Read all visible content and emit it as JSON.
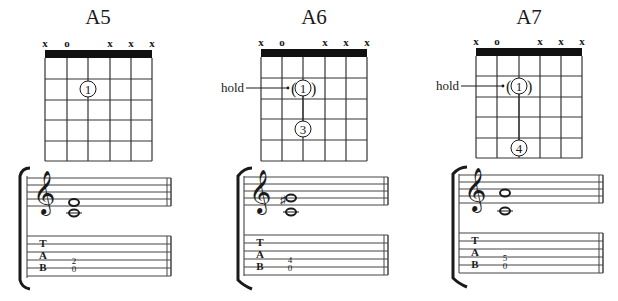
{
  "colors": {
    "ink": "#1a1a1a",
    "line": "#333333",
    "background": "#ffffff"
  },
  "chords": [
    {
      "name": "A5",
      "string_markers": [
        "x",
        "o",
        "",
        "x",
        "x",
        "x"
      ],
      "frets_shown": 5,
      "fingers": [
        {
          "string": 3,
          "fret": 2,
          "finger": "1",
          "hold": false
        }
      ],
      "hold_label": "",
      "notation": {
        "clef": "treble",
        "notes": [
          "A3",
          "E4"
        ],
        "accidental": "",
        "tab": {
          "string5": "0",
          "string4": "2"
        },
        "tab_top": "2",
        "tab_bottom": "0"
      }
    },
    {
      "name": "A6",
      "string_markers": [
        "x",
        "o",
        "",
        "x",
        "x",
        "x"
      ],
      "frets_shown": 5,
      "fingers": [
        {
          "string": 3,
          "fret": 2,
          "finger": "1",
          "hold": true
        },
        {
          "string": 3,
          "fret": 4,
          "finger": "3",
          "hold": false
        }
      ],
      "hold_label": "hold",
      "notation": {
        "clef": "treble",
        "notes": [
          "A3",
          "F#4"
        ],
        "accidental": "♯",
        "tab": {
          "string5": "0",
          "string4": "4"
        },
        "tab_top": "4",
        "tab_bottom": "0"
      }
    },
    {
      "name": "A7",
      "string_markers": [
        "x",
        "o",
        "",
        "x",
        "x",
        "x"
      ],
      "frets_shown": 5,
      "fingers": [
        {
          "string": 3,
          "fret": 2,
          "finger": "1",
          "hold": true
        },
        {
          "string": 3,
          "fret": 5,
          "finger": "4",
          "hold": false
        }
      ],
      "hold_label": "hold",
      "notation": {
        "clef": "treble",
        "notes": [
          "A3",
          "G4"
        ],
        "accidental": "",
        "tab": {
          "string5": "0",
          "string4": "5"
        },
        "tab_top": "5",
        "tab_bottom": "0"
      }
    }
  ],
  "tab_clef_letters": [
    "T",
    "A",
    "B"
  ]
}
